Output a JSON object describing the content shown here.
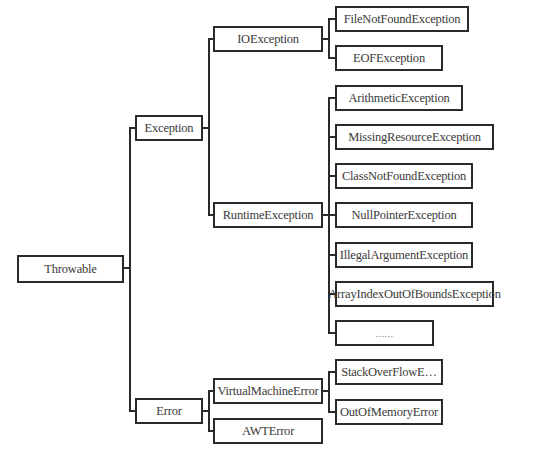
{
  "diagram": {
    "root": {
      "label": "Throwable",
      "children": [
        {
          "label": "Exception",
          "children": [
            {
              "label": "IOException",
              "children": [
                {
                  "label": "FileNotFoundException"
                },
                {
                  "label": "EOFException"
                }
              ]
            },
            {
              "label": "RuntimeException",
              "children": [
                {
                  "label": "ArithmeticException"
                },
                {
                  "label": "MissingResourceException"
                },
                {
                  "label": "ClassNotFoundException"
                },
                {
                  "label": "NullPointerException"
                },
                {
                  "label": "IllegalArgumentException"
                },
                {
                  "label": "ArrayIndexOutOfBoundsException"
                },
                {
                  "label": "......"
                }
              ]
            }
          ]
        },
        {
          "label": "Error",
          "children": [
            {
              "label": "VirtualMachineError",
              "children": [
                {
                  "label": "StackOverFlowE…"
                },
                {
                  "label": "OutOfMemoryError"
                }
              ]
            },
            {
              "label": "AWTError"
            }
          ]
        }
      ]
    }
  },
  "colors": {
    "stroke": "#2a2a2a",
    "text": "#3a3a3a",
    "background": "#ffffff"
  }
}
